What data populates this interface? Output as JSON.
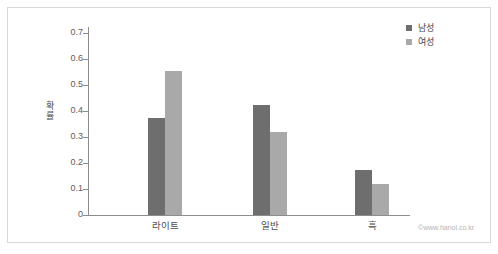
{
  "chart_data": {
    "type": "bar",
    "title": "",
    "xlabel": "",
    "ylabel": "확률",
    "categories": [
      "라이트",
      "일반",
      "흑"
    ],
    "series": [
      {
        "name": "남성",
        "color": "#6e6e6e",
        "values": [
          0.375,
          0.425,
          0.175
        ]
      },
      {
        "name": "여성",
        "color": "#a9a9a9",
        "values": [
          0.555,
          0.32,
          0.12
        ]
      }
    ],
    "ylim": [
      0,
      0.7
    ],
    "yticks": [
      0,
      0.1,
      0.2,
      0.3,
      0.4,
      0.5,
      0.6,
      0.7
    ],
    "ytick_labels": [
      "0",
      "0.1",
      "0.2",
      "0.3",
      "0.4",
      "0.5",
      "0.6",
      "0.7"
    ],
    "grid": false,
    "legend_position": "top-right"
  },
  "legend": {
    "entries": [
      {
        "label": "남성",
        "color": "#6e6e6e"
      },
      {
        "label": "여성",
        "color": "#a9a9a9"
      }
    ]
  },
  "axis": {
    "y_title_chars": [
      "확",
      "률"
    ],
    "axis_color": "#8d8d8d"
  },
  "watermark": {
    "text": "©www.hanol.co.kr"
  },
  "frame": {
    "border_color": "#d8d8d8",
    "background": "#ffffff"
  }
}
